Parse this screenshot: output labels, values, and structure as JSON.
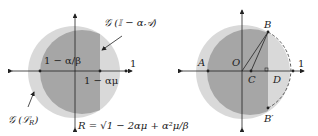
{
  "left_diagram": {
    "label_top": "𝒢 (𝕀 − α𝒜)",
    "label_inner": "1 − α/β",
    "label_axis": "1 − αμ",
    "label_one": "1",
    "label_bottom_left": "𝒢 (ℒ",
    "label_bottom_left_sub": "R",
    "label_bottom_left_close": ")",
    "radius_formula": "R = √1 − 2αμ + α²μ/β"
  },
  "right_diagram": {
    "points": {
      "A": "A",
      "O": "O",
      "B": "B",
      "B_prime": "B′",
      "C": "C",
      "D": "D",
      "one": "1"
    }
  },
  "colors": {
    "light_region": "#d9d9d9",
    "dark_region": "#a6a6a6",
    "axis": "#222222"
  }
}
